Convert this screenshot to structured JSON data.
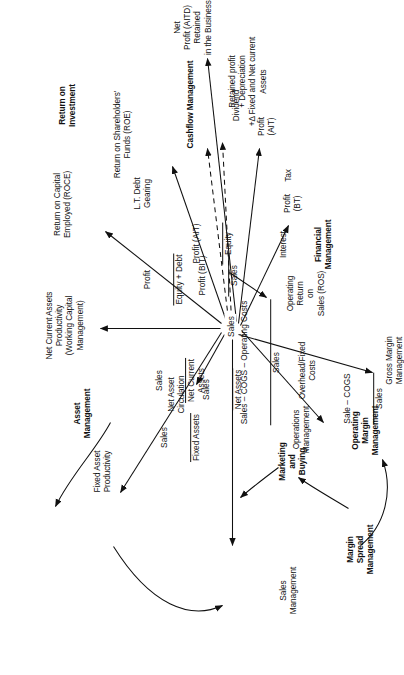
{
  "diagram": {
    "type": "node-link-diagram",
    "orientation": "rotated-90-ccw",
    "hub": {
      "label": "Sales"
    },
    "colors": {
      "ink": "#101010",
      "background": "#ffffff"
    },
    "clusters": [
      {
        "id": "asset-management",
        "label": "Asset\nManagement"
      },
      {
        "id": "return-on-investment",
        "label": "Return on\nInvestment"
      },
      {
        "id": "cashflow-management",
        "label": "Cashflow Management"
      },
      {
        "id": "sales-management",
        "label": "Sales\nManagement"
      },
      {
        "id": "marketing-and-buying",
        "label": "Marketing\nand\nBuying"
      },
      {
        "id": "margin-spread-management",
        "label": "Margin\nSpread\nManagement"
      },
      {
        "id": "operating-margin-management",
        "label": "Operating\nMargin\nManagement"
      },
      {
        "id": "financial-management",
        "label": "Financial\nManagement"
      }
    ],
    "nodes": [
      {
        "id": "net-current-assets-productivity",
        "label": "Net Current Assets\nProductivity\n(Working Capital\nManagement)"
      },
      {
        "id": "fixed-asset-productivity",
        "label": "Fixed Asset\nProductivity"
      },
      {
        "id": "net-asset-circulation",
        "label": "Net Asset\nCirculation"
      },
      {
        "id": "return-on-capital-employed",
        "label": "Return on Capital\nEmployed (ROCE)"
      },
      {
        "id": "lt-debt-gearing",
        "label": "L.T. Debt\nGearing"
      },
      {
        "id": "return-on-shareholders-funds",
        "label": "Return on Shareholders'\nFunds (ROE)"
      },
      {
        "id": "cashflow-detail",
        "label": "Retained profit\n+ Depreciation\n+Δ Fixed and Net current\nAssets"
      },
      {
        "id": "net-profit-aitd-retained",
        "label": "Net\nProfit (AITD)\nRetained\nin the Business"
      },
      {
        "id": "dividend",
        "label": "Dividend"
      },
      {
        "id": "profit-ait",
        "label": "Profit\n(AIT)"
      },
      {
        "id": "tax",
        "label": "Tax"
      },
      {
        "id": "profit-bt",
        "label": "Profit\n(BT)"
      },
      {
        "id": "interest",
        "label": "Interest"
      },
      {
        "id": "operating-return-on-sales",
        "label": "Operating\nReturn\non\nSales (ROS)"
      },
      {
        "id": "overhead-fixed-costs",
        "label": "Overhead/Fixed\nCosts"
      },
      {
        "id": "operations-management",
        "label": "Operations\nManagement"
      },
      {
        "id": "gross-margin-management",
        "label": "Gross Margin\nManagement"
      }
    ],
    "ratios": [
      {
        "id": "sales-over-net-assets",
        "numerator": "Sales",
        "denominator": "Net Assets"
      },
      {
        "id": "sales-over-fixed-assets",
        "numerator": "Sales",
        "denominator": "Fixed Assets"
      },
      {
        "id": "sales-over-net-current-assets",
        "numerator": "Sales",
        "denominator": "Net Current\nAssets"
      },
      {
        "id": "profit-over-equity-plus-debt",
        "numerator": "Profit",
        "denominator": "Equity + Debt"
      },
      {
        "id": "profit-ait-over-equity",
        "numerator": "Profit (AIT)",
        "denominator": "Equity"
      },
      {
        "id": "sale-minus-cogs-over-sales",
        "numerator": "Sale – COGS",
        "denominator": "Sales"
      },
      {
        "id": "sales-cogs-opcosts-over-sales",
        "numerator": "Sales – COGS – Operating Costs",
        "denominator": "Sales"
      },
      {
        "id": "profit-bit-over-sales",
        "numerator": "Profit (BIT)",
        "denominator": "Sales"
      }
    ]
  }
}
